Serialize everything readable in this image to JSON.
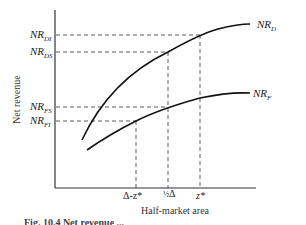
{
  "diagram": {
    "axes": {
      "x_label": "Half-market area",
      "y_label": "Net revenue"
    },
    "y_levels": [
      {
        "id": "NR_DI",
        "base": "NR",
        "sub": "DI"
      },
      {
        "id": "NR_DS",
        "base": "NR",
        "sub": "DS"
      },
      {
        "id": "NR_FS",
        "base": "NR",
        "sub": "FS"
      },
      {
        "id": "NR_FI",
        "base": "NR",
        "sub": "FI"
      }
    ],
    "x_ticks": [
      {
        "id": "delta_minus_z",
        "label": "Δ-z*"
      },
      {
        "id": "half_delta",
        "frac": "½",
        "label": "Δ"
      },
      {
        "id": "z_star",
        "label": "z*"
      }
    ],
    "curves": [
      {
        "id": "NR_D",
        "base": "NR",
        "sub": "D"
      },
      {
        "id": "NR_F",
        "base": "NR",
        "sub": "F"
      }
    ],
    "caption": "Fig. 10.4  Net revenue ..."
  }
}
